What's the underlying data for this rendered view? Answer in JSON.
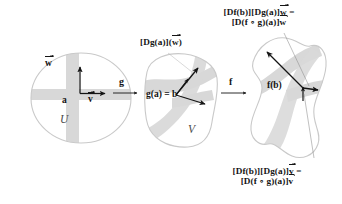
{
  "figure": {
    "type": "chain-rule-commutative-diagram"
  },
  "regions": {
    "domain_u": {
      "label": "U",
      "point_label": "a"
    },
    "domain_v": {
      "label": "V",
      "point_label": "g(a) = b"
    },
    "domain_w": {
      "point_label": "f(b)"
    }
  },
  "maps": {
    "g": "g",
    "f": "f"
  },
  "vectors": {
    "w_source": "w",
    "v_source": "v",
    "dg_w": {
      "prefix": "[Dg(a)](",
      "vec": "w",
      "suffix": ")"
    }
  },
  "annotations": {
    "top_right": {
      "line1_a": "[Df(b)][Dg(a)]",
      "line1_vec": "w",
      "line1_b": " =",
      "line2_a": "[D(f ∘ g)(a)]",
      "line2_vec": "w"
    },
    "bottom_right": {
      "line1_a": "[Df(b)][Dg(a)]",
      "line1_vec": "v",
      "line1_b": " =",
      "line2_a": "[D(f ∘ g)(a)]",
      "line2_vec": "v"
    }
  },
  "colors": {
    "band": "#d8d8d8",
    "outline": "#c9c9c9",
    "ink": "#141414",
    "italic_ink": "#4a4a4a"
  }
}
